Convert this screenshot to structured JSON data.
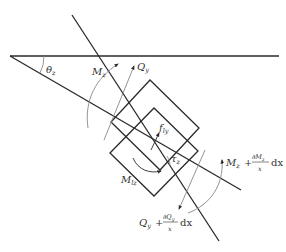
{
  "diagram": {
    "labels": {
      "theta": {
        "main": "θ",
        "sub": "z"
      },
      "M_left": {
        "main": "M",
        "sub": "z"
      },
      "Q_left": {
        "main": "Q",
        "sub": "y"
      },
      "f_ly": {
        "main": "f",
        "sub": "ly"
      },
      "tau": {
        "main": "τ",
        "sub": "z"
      },
      "M_lz": {
        "main": "M",
        "sub": "lz"
      },
      "M_right": {
        "main": "M",
        "sub": "z",
        "plus": "+",
        "num": "∂M",
        "num_sub": "z",
        "den": "x",
        "dx": "dx"
      },
      "Q_right": {
        "main": "Q",
        "sub": "y",
        "plus": "+",
        "num": "∂Q",
        "num_sub": "y",
        "den": "x",
        "dx": "dx"
      }
    },
    "colors": {
      "line": "#2a2a2a",
      "arc": "#888888"
    }
  }
}
